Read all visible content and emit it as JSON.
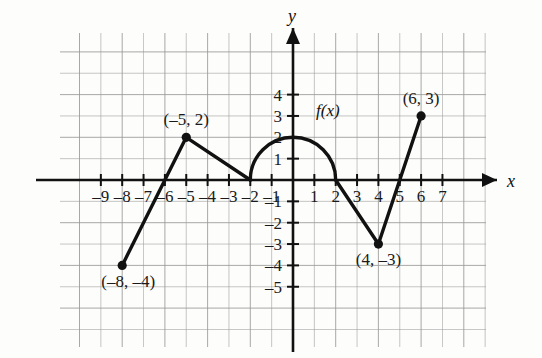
{
  "figure": {
    "title": "",
    "axis_labels": {
      "x": "x",
      "y": "y"
    },
    "function_label": "f(x)"
  },
  "chart_data": {
    "type": "line",
    "title": "",
    "xlabel": "x",
    "ylabel": "y",
    "xlim": [
      -11,
      9
    ],
    "ylim": [
      -7,
      6
    ],
    "grid": true,
    "legend": "none",
    "x_ticks": [
      -9,
      -8,
      -7,
      -6,
      -5,
      -4,
      -3,
      -2,
      -1,
      1,
      2,
      3,
      4,
      5,
      6,
      7
    ],
    "x_tick_labels": [
      "–9",
      "–8",
      "–7",
      "–6",
      "–5",
      "–4",
      "–3",
      "–2",
      "–1",
      "1",
      "2",
      "3",
      "4",
      "5",
      "6",
      "7"
    ],
    "y_ticks": [
      4,
      3,
      2,
      1,
      -1,
      -2,
      -3,
      -4,
      -5
    ],
    "y_tick_labels": [
      "4",
      "3",
      "2",
      "1",
      "–1",
      "–2",
      "–3",
      "–4",
      "–5"
    ],
    "series": [
      {
        "name": "f(x)",
        "segments": [
          {
            "kind": "line",
            "points": [
              [
                -8,
                -4
              ],
              [
                -5,
                2
              ]
            ]
          },
          {
            "kind": "line",
            "points": [
              [
                -5,
                2
              ],
              [
                -2,
                0
              ]
            ]
          },
          {
            "kind": "semicircle-arc",
            "points": [
              [
                -2,
                0
              ],
              [
                0,
                2
              ],
              [
                2,
                0
              ]
            ]
          },
          {
            "kind": "line",
            "points": [
              [
                2,
                0
              ],
              [
                4,
                -3
              ]
            ]
          },
          {
            "kind": "line",
            "points": [
              [
                4,
                -3
              ],
              [
                6,
                3
              ]
            ]
          }
        ]
      }
    ],
    "marked_points": [
      {
        "x": -8,
        "y": -4,
        "label": "(–8, –4)",
        "label_position": "below-right"
      },
      {
        "x": -5,
        "y": 2,
        "label": "(–5, 2)",
        "label_position": "above"
      },
      {
        "x": 4,
        "y": -3,
        "label": "(4, –3)",
        "label_position": "below"
      },
      {
        "x": 6,
        "y": 3,
        "label": "(6, 3)",
        "label_position": "above"
      }
    ],
    "annotations": [
      {
        "text": "f(x)",
        "x": 1.0,
        "y": 2.2
      }
    ],
    "colors": {
      "curve": "#111111",
      "axis": "#111111",
      "grid": "#9a9a9a",
      "background": "#fdfdfb",
      "point": "#111111"
    }
  }
}
